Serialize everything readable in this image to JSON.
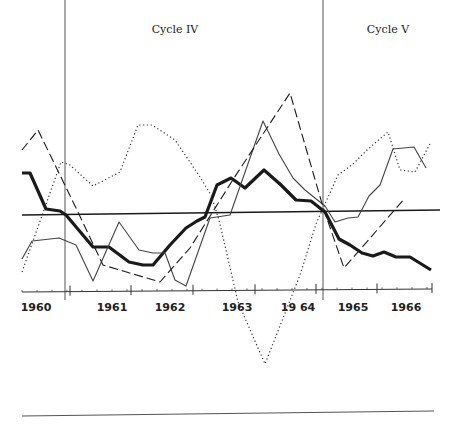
{
  "chart_data": {
    "type": "line",
    "title": "",
    "xlabel": "",
    "ylabel": "",
    "grid": false,
    "legend": null,
    "annotations": [
      {
        "label": "Cycle  IV",
        "x_px": 175,
        "y_px": 33
      },
      {
        "label": "Cycle  V",
        "x_px": 388,
        "y_px": 33
      }
    ],
    "x_tick_labels": [
      {
        "label": "1960",
        "x_px": 36
      },
      {
        "label": "1961",
        "x_px": 112
      },
      {
        "label": "1962",
        "x_px": 170
      },
      {
        "label": "1963",
        "x_px": 237
      },
      {
        "label": "19 64",
        "x_px": 298
      },
      {
        "label": "1965",
        "x_px": 353
      },
      {
        "label": "1966",
        "x_px": 406
      }
    ],
    "cycle_dividers_px": [
      65,
      323
    ],
    "baseline_y_px": 214,
    "axis": {
      "y_px": 292,
      "x_start_px": 22,
      "x_end_px": 432
    },
    "bottom_rule": {
      "x1": 22,
      "y1": 416,
      "x2": 434,
      "y2": 411
    },
    "series": [
      {
        "name": "heavy-solid",
        "style": "solid",
        "width": 3.2,
        "points": [
          [
            22,
            173
          ],
          [
            30,
            173
          ],
          [
            46,
            209
          ],
          [
            60,
            211
          ],
          [
            66,
            215
          ],
          [
            93,
            247
          ],
          [
            109,
            247
          ],
          [
            129,
            262
          ],
          [
            143,
            265
          ],
          [
            153,
            265
          ],
          [
            170,
            245
          ],
          [
            186,
            228
          ],
          [
            197,
            221
          ],
          [
            205,
            217
          ],
          [
            217,
            185
          ],
          [
            231,
            178
          ],
          [
            245,
            188
          ],
          [
            264,
            170
          ],
          [
            281,
            185
          ],
          [
            296,
            200
          ],
          [
            311,
            201
          ],
          [
            325,
            212
          ],
          [
            339,
            239
          ],
          [
            350,
            245
          ],
          [
            362,
            253
          ],
          [
            373,
            256
          ],
          [
            384,
            252
          ],
          [
            396,
            257
          ],
          [
            410,
            257
          ],
          [
            431,
            270
          ]
        ]
      },
      {
        "name": "thin-solid",
        "style": "solid",
        "width": 1.1,
        "points": [
          [
            22,
            259
          ],
          [
            32,
            241
          ],
          [
            59,
            238
          ],
          [
            76,
            245
          ],
          [
            93,
            281
          ],
          [
            119,
            222
          ],
          [
            139,
            250
          ],
          [
            153,
            253
          ],
          [
            165,
            253
          ],
          [
            175,
            280
          ],
          [
            186,
            286
          ],
          [
            210,
            218
          ],
          [
            230,
            215
          ],
          [
            263,
            121
          ],
          [
            279,
            154
          ],
          [
            293,
            178
          ],
          [
            305,
            190
          ],
          [
            325,
            206
          ],
          [
            335,
            222
          ],
          [
            348,
            218
          ],
          [
            358,
            217
          ],
          [
            369,
            196
          ],
          [
            380,
            185
          ],
          [
            393,
            149
          ],
          [
            414,
            147
          ],
          [
            426,
            168
          ]
        ]
      },
      {
        "name": "dashed",
        "style": "dashed",
        "width": 1.1,
        "points": [
          [
            22,
            150
          ],
          [
            38,
            130
          ],
          [
            77,
            210
          ],
          [
            103,
            265
          ],
          [
            160,
            282
          ],
          [
            190,
            248
          ],
          [
            234,
            178
          ],
          [
            290,
            93
          ],
          [
            323,
            207
          ],
          [
            344,
            268
          ],
          [
            405,
            198
          ]
        ]
      },
      {
        "name": "dotted",
        "style": "dotted",
        "width": 1.2,
        "points": [
          [
            22,
            272
          ],
          [
            61,
            162
          ],
          [
            70,
            165
          ],
          [
            93,
            186
          ],
          [
            120,
            172
          ],
          [
            138,
            125
          ],
          [
            152,
            125
          ],
          [
            175,
            140
          ],
          [
            200,
            177
          ],
          [
            211,
            195
          ],
          [
            219,
            220
          ],
          [
            238,
            302
          ],
          [
            265,
            364
          ],
          [
            300,
            275
          ],
          [
            316,
            224
          ],
          [
            338,
            175
          ],
          [
            353,
            164
          ],
          [
            367,
            150
          ],
          [
            388,
            132
          ],
          [
            400,
            170
          ],
          [
            415,
            172
          ],
          [
            430,
            144
          ]
        ]
      }
    ]
  }
}
